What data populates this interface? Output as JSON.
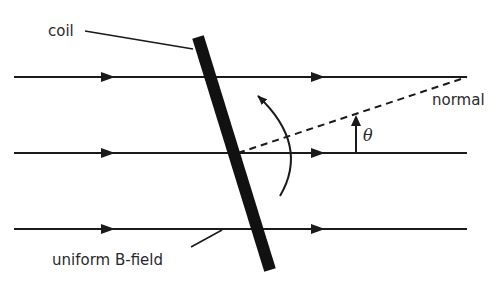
{
  "diagram": {
    "labels": {
      "coil": "coil",
      "normal": "normal",
      "theta": "θ",
      "field": "uniform B-field"
    },
    "field_lines": [
      {
        "y": 77,
        "x1": 14,
        "x2": 467,
        "arrows_at": [
          108,
          318
        ]
      },
      {
        "y": 153,
        "x1": 14,
        "x2": 467,
        "arrows_at": [
          108,
          318
        ]
      },
      {
        "y": 229,
        "x1": 14,
        "x2": 467,
        "arrows_at": [
          108,
          318
        ]
      }
    ],
    "coil": {
      "x1": 198,
      "y1": 37,
      "x2": 270,
      "y2": 270,
      "thickness": 12
    },
    "normal_line": {
      "x1": 238,
      "y1": 153,
      "x2": 467,
      "y2": 77,
      "style": "dashed"
    },
    "colors": {
      "ink": "#1a1a1a",
      "text": "#2a2a2a",
      "background": "#ffffff"
    }
  }
}
